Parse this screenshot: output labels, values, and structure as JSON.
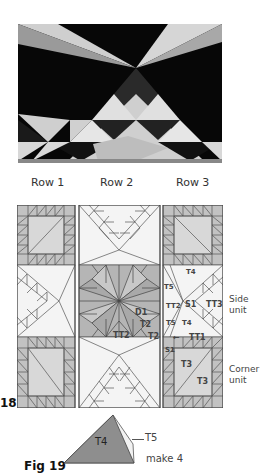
{
  "photo": {
    "alt": "Quilt photo: flying geese triangles and hourglass in black and light prints"
  },
  "rows": [
    {
      "label": "Row 1"
    },
    {
      "label": "Row 2"
    },
    {
      "label": "Row 3"
    }
  ],
  "diagram": {
    "labels": {
      "t4_top": "T4",
      "t5_left": "T5",
      "tt2_left": "TT2",
      "s1_mid": "S1",
      "tt3": "TT3",
      "t5_bottom": "T5",
      "t4_bottom": "T4",
      "tt1": "TT1",
      "arrow": "←",
      "s1_corner": "S1",
      "t3_a": "T3",
      "t3_b": "T3",
      "d1": "D1",
      "t2_a": "T2",
      "t2_b": "T2",
      "tt2_center": "TT2"
    },
    "side_unit": [
      "Side",
      "unit"
    ],
    "corner_unit": [
      "Corner",
      "unit"
    ],
    "fig_number": "18"
  },
  "fig19": {
    "title": "Fig 19",
    "t4": "T4",
    "t5": "T5",
    "note": "make 4"
  },
  "colors": {
    "gray_fill": "#b8b8b8",
    "light_fill": "#dcdcdc",
    "line": "#555555"
  }
}
